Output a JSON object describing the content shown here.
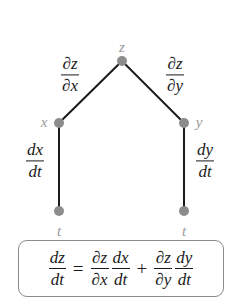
{
  "colors": {
    "edge": "#1a1a1a",
    "node": "#8c8c8c",
    "node_label": "#9a9a9a",
    "text": "#1a1a1a",
    "box_border": "#8a8a8a"
  },
  "nodes": {
    "z": {
      "label": "z",
      "x": 122,
      "y": 61
    },
    "x": {
      "label": "x",
      "x": 59,
      "y": 123
    },
    "y": {
      "label": "y",
      "x": 184,
      "y": 123
    },
    "t_left": {
      "label": "t",
      "x": 59,
      "y": 211
    },
    "t_right": {
      "label": "t",
      "x": 184,
      "y": 211
    }
  },
  "edges": [
    {
      "from": "z",
      "to": "x",
      "label": {
        "num": "∂z",
        "den": "∂x"
      }
    },
    {
      "from": "z",
      "to": "y",
      "label": {
        "num": "∂z",
        "den": "∂y"
      }
    },
    {
      "from": "x",
      "to": "t_left",
      "label": {
        "num": "dx",
        "den": "dt"
      }
    },
    {
      "from": "y",
      "to": "t_right",
      "label": {
        "num": "dy",
        "den": "dt"
      }
    }
  ],
  "formula": {
    "lhs": {
      "num": "dz",
      "den": "dt"
    },
    "equals": "=",
    "term1": {
      "a": {
        "num": "∂z",
        "den": "∂x"
      },
      "b": {
        "num": "dx",
        "den": "dt"
      }
    },
    "plus": "+",
    "term2": {
      "a": {
        "num": "∂z",
        "den": "∂y"
      },
      "b": {
        "num": "dy",
        "den": "dt"
      }
    }
  }
}
